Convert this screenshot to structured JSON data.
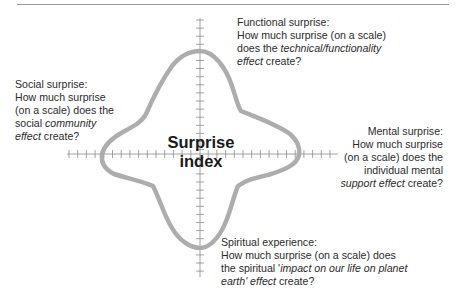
{
  "diagram": {
    "title": "Surprise index",
    "center_label_line1": "Surprise",
    "center_label_line2": "index",
    "axes": {
      "vertical": {
        "tick_count": 21
      },
      "horizontal": {
        "tick_count": 21
      }
    },
    "curve_color": "#a9a9a9",
    "axis_color": "#8c8c8c",
    "dimensions": [
      {
        "id": "functional",
        "title": "Functional surprise:",
        "line2": "How much surprise (on a scale)",
        "line3_prefix": "does the ",
        "line3_italic": "technical/functionality",
        "line4_italic": "effect",
        "line4_suffix": " create?"
      },
      {
        "id": "social",
        "title": "Social surprise:",
        "line2": "How much surprise",
        "line3": "(on a scale) does the",
        "line4_prefix": "social ",
        "line4_italic": "community",
        "line5_italic": "effect",
        "line5_suffix": " create?"
      },
      {
        "id": "mental",
        "title": "Mental surprise:",
        "line2": "How much surprise",
        "line3": "(on a scale) does the",
        "line4": "individual mental",
        "line5_italic": "support effect",
        "line5_suffix": " create?"
      },
      {
        "id": "spiritual",
        "title": "Spiritual experience:",
        "line2": "How much surprise (on a scale) does",
        "line3_prefix": "the spiritual '",
        "line3_italic": "impact on our life on planet",
        "line4_italic": "earth' effect",
        "line4_suffix": " create?"
      }
    ]
  }
}
